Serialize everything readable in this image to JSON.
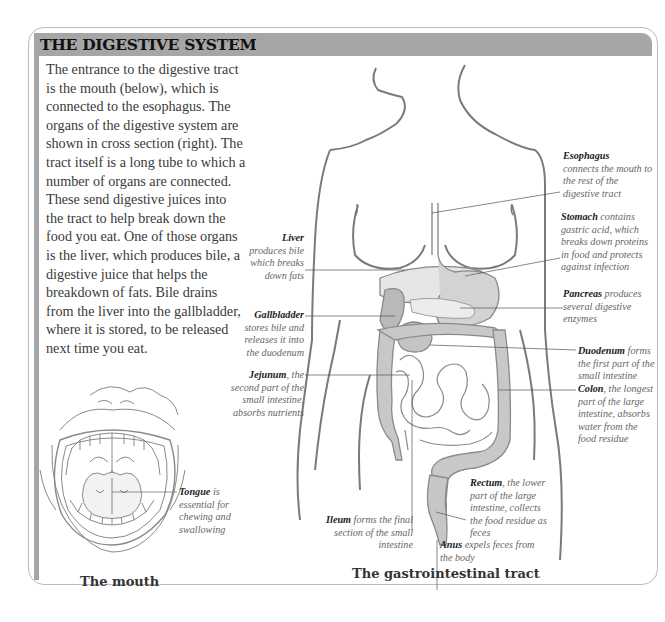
{
  "title": "THE DIGESTIVE SYSTEM",
  "intro_text": "The entrance to the digestive tract is the mouth (below), which is connected to the esophagus. The organs of the digestive system are shown in cross section (right). The tract itself is a long tube to which a number of organs are connected. These send digestive juices into the tract to help break down the food you eat. One of those organs is the liver, which produces bile, a digestive juice that helps the breakdown of fats. Bile drains from the liver into the gallbladder, where it is stored, to be released next time you eat.",
  "mouth": {
    "caption": "The mouth",
    "labels": [
      {
        "name": "Tongue",
        "text": " is essential for chewing and swallowing"
      }
    ]
  },
  "tract": {
    "caption": "The gastrointestinal tract",
    "labels": {
      "esophagus": {
        "name": "Esophagus",
        "text": " connects the mouth to the rest of the digestive tract"
      },
      "stomach": {
        "name": "Stomach",
        "text": " contains gastric acid, which breaks down proteins in food and protects against infection"
      },
      "pancreas": {
        "name": "Pancreas",
        "text": " produces several digestive enzymes"
      },
      "duodenum": {
        "name": "Duodenum",
        "text": " forms the first part of the small intestine"
      },
      "colon": {
        "name": "Colon",
        "text": ", the longest part of the large intestine, absorbs water from the food residue"
      },
      "rectum": {
        "name": "Rectum",
        "text": ", the lower part of the large intestine, collects the food residue as feces"
      },
      "anus": {
        "name": "Anus",
        "text": " expels feces from the body"
      },
      "ileum": {
        "name": "Ileum",
        "text": " forms the final section of the small intestine"
      },
      "liver": {
        "name": "Liver",
        "text": "produces bile which breaks down fats"
      },
      "gallbladder": {
        "name": "Gallbladder",
        "text": "stores bile and releases it into the duodenum"
      },
      "jejunum": {
        "name": "Jejunum",
        "text": ", the second part of the small intestine, absorbs nutrients"
      }
    }
  },
  "colors": {
    "header_bg": "#a6a6a6",
    "border": "#bdbdbd",
    "organ_fill": "#c8c8c8",
    "outline": "#8a8a8a"
  }
}
